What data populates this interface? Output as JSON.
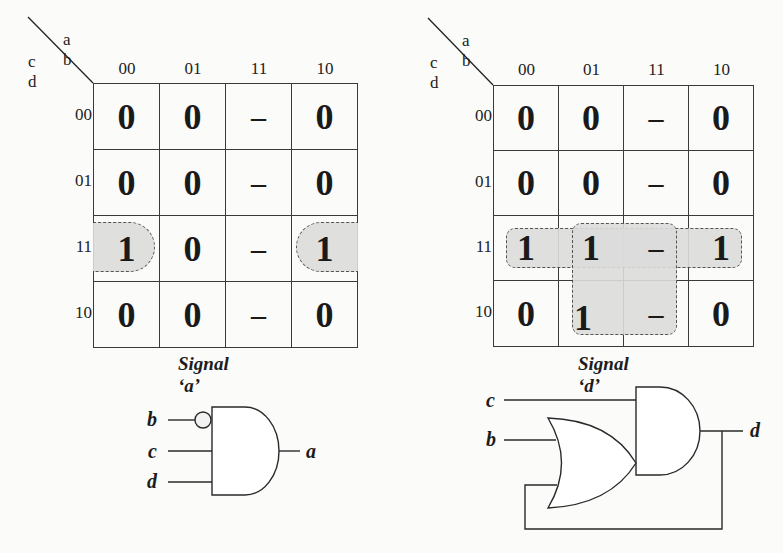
{
  "background_colors": {
    "page": "#fbfbfa",
    "group_fill": "#dcdcdc",
    "line": "#3a3a3a"
  },
  "kmaps": [
    {
      "id": "a",
      "col_var": "a b",
      "row_var": "c d",
      "col_headers": [
        "00",
        "01",
        "11",
        "10"
      ],
      "row_headers": [
        "00",
        "01",
        "11",
        "10"
      ],
      "cells": [
        [
          "0",
          "0",
          "–",
          "0"
        ],
        [
          "0",
          "0",
          "–",
          "0"
        ],
        [
          "1",
          "0",
          "–",
          "1"
        ],
        [
          "0",
          "0",
          "–",
          "0"
        ]
      ],
      "caption": "Signal ‘a’",
      "groups": [
        "row 11 cols 00 and 10 (wrap-around)"
      ]
    },
    {
      "id": "d",
      "col_var": "a b",
      "row_var": "c d",
      "col_headers": [
        "00",
        "01",
        "11",
        "10"
      ],
      "row_headers": [
        "00",
        "01",
        "11",
        "10"
      ],
      "cells": [
        [
          "0",
          "0",
          "–",
          "0"
        ],
        [
          "0",
          "0",
          "–",
          "0"
        ],
        [
          "1",
          "1",
          "–",
          "1"
        ],
        [
          "0",
          "1",
          "–",
          "0"
        ]
      ],
      "caption": "Signal ‘d’",
      "groups": [
        "row 11 all columns",
        "rows 11-10 cols 01-11"
      ]
    }
  ],
  "circuits": {
    "left": {
      "gate": "AND",
      "inputs": [
        "b",
        "c",
        "d"
      ],
      "inverted_input": "b",
      "output": "a"
    },
    "right": {
      "gates": [
        "OR",
        "AND"
      ],
      "inputs": [
        "c",
        "b"
      ],
      "output": "d",
      "feedback": "d fed back into OR gate"
    }
  }
}
